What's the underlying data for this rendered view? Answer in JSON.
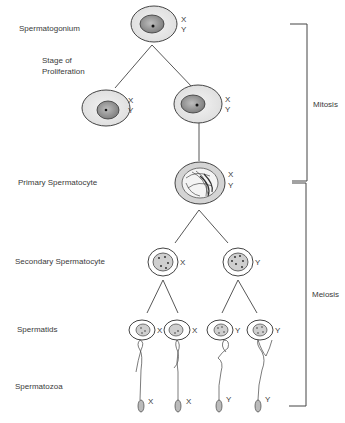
{
  "diagram": {
    "stage_labels": {
      "spermatogonium": "Spermatogonium",
      "proliferation_line1": "Stage of",
      "proliferation_line2": "Proliferation",
      "primary": "Primary Spermatocyte",
      "secondary": "Secondary Spermatocyte",
      "spermatids": "Spermatids",
      "spermatozoa": "Spermatozoa"
    },
    "phase_labels": {
      "mitosis": "Mitosis",
      "meiosis": "Meiosis"
    },
    "chromosomes": {
      "spermatogonium": [
        "X",
        "Y"
      ],
      "proliferation_left": [
        "X",
        "Y"
      ],
      "proliferation_right": [
        "X",
        "Y"
      ],
      "primary": [
        "X",
        "Y"
      ],
      "secondary": [
        "X",
        "Y"
      ],
      "spermatids": [
        "X",
        "X",
        "Y",
        "Y"
      ],
      "spermatozoa": [
        "X",
        "X",
        "Y",
        "Y"
      ]
    }
  }
}
